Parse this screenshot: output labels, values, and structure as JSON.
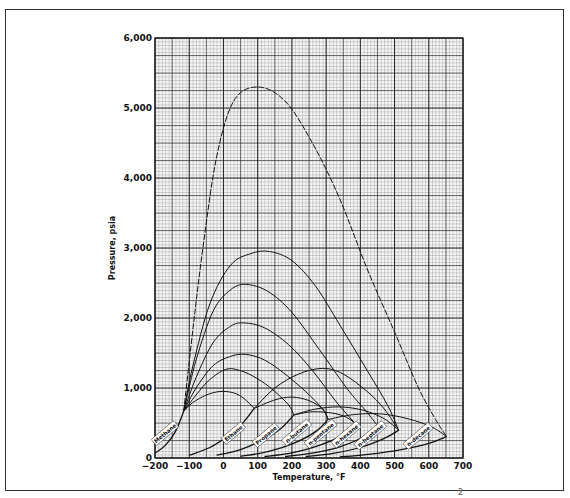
{
  "chart_data": {
    "type": "line",
    "title": "",
    "xlabel": "Temperature, °F",
    "ylabel": "Pressure, psia",
    "xlim": [
      -200,
      700
    ],
    "ylim": [
      0,
      6000
    ],
    "x_ticks": [
      "-200",
      "-100",
      "0",
      "100",
      "200",
      "300",
      "400",
      "500",
      "600",
      "700"
    ],
    "y_ticks": [
      "0",
      "1,000",
      "2,000",
      "3,000",
      "4,000",
      "5,000",
      "6,000"
    ],
    "grid": true,
    "vapor_pressure_curves": [
      {
        "name": "Methane",
        "points": [
          [
            -200,
            70
          ],
          [
            -170,
            180
          ],
          [
            -140,
            380
          ],
          [
            -116,
            668
          ]
        ]
      },
      {
        "name": "Ethane",
        "points": [
          [
            -100,
            40
          ],
          [
            -40,
            150
          ],
          [
            20,
            340
          ],
          [
            60,
            520
          ],
          [
            90,
            708
          ]
        ]
      },
      {
        "name": "Propane",
        "points": [
          [
            -20,
            40
          ],
          [
            50,
            120
          ],
          [
            120,
            270
          ],
          [
            170,
            430
          ],
          [
            206,
            616
          ]
        ]
      },
      {
        "name": "n-butane",
        "points": [
          [
            50,
            25
          ],
          [
            130,
            90
          ],
          [
            210,
            220
          ],
          [
            270,
            380
          ],
          [
            306,
            551
          ]
        ]
      },
      {
        "name": "n-pentane",
        "points": [
          [
            120,
            20
          ],
          [
            200,
            75
          ],
          [
            280,
            180
          ],
          [
            350,
            330
          ],
          [
            386,
            489
          ]
        ]
      },
      {
        "name": "n-hexane",
        "points": [
          [
            180,
            20
          ],
          [
            260,
            70
          ],
          [
            340,
            160
          ],
          [
            410,
            300
          ],
          [
            454,
            437
          ]
        ]
      },
      {
        "name": "n-heptane",
        "points": [
          [
            240,
            20
          ],
          [
            320,
            65
          ],
          [
            400,
            150
          ],
          [
            470,
            280
          ],
          [
            512,
            397
          ]
        ]
      },
      {
        "name": "n-decane",
        "points": [
          [
            340,
            15
          ],
          [
            430,
            55
          ],
          [
            520,
            120
          ],
          [
            600,
            210
          ],
          [
            652,
            305
          ]
        ]
      }
    ],
    "critical_loci": [
      {
        "name": "Methane–n-decane",
        "points": [
          [
            -116,
            668
          ],
          [
            -90,
            1800
          ],
          [
            -60,
            3000
          ],
          [
            -20,
            4300
          ],
          [
            30,
            5100
          ],
          [
            100,
            5300
          ],
          [
            180,
            5100
          ],
          [
            260,
            4500
          ],
          [
            340,
            3700
          ],
          [
            420,
            2700
          ],
          [
            500,
            1800
          ],
          [
            570,
            1000
          ],
          [
            620,
            550
          ],
          [
            652,
            305
          ]
        ]
      },
      {
        "name": "Methane–n-heptane",
        "points": [
          [
            -116,
            668
          ],
          [
            -90,
            1300
          ],
          [
            -40,
            2200
          ],
          [
            20,
            2750
          ],
          [
            80,
            2920
          ],
          [
            135,
            2950
          ],
          [
            200,
            2820
          ],
          [
            270,
            2450
          ],
          [
            340,
            1900
          ],
          [
            420,
            1250
          ],
          [
            480,
            750
          ],
          [
            512,
            397
          ]
        ]
      },
      {
        "name": "Methane–n-hexane",
        "points": [
          [
            -116,
            668
          ],
          [
            -80,
            1400
          ],
          [
            -30,
            2100
          ],
          [
            20,
            2400
          ],
          [
            65,
            2480
          ],
          [
            130,
            2380
          ],
          [
            200,
            2080
          ],
          [
            280,
            1550
          ],
          [
            360,
            1000
          ],
          [
            420,
            650
          ],
          [
            454,
            437
          ]
        ]
      },
      {
        "name": "Methane–n-pentane",
        "points": [
          [
            -116,
            668
          ],
          [
            -80,
            1150
          ],
          [
            -30,
            1650
          ],
          [
            20,
            1880
          ],
          [
            60,
            1930
          ],
          [
            120,
            1860
          ],
          [
            190,
            1620
          ],
          [
            260,
            1250
          ],
          [
            330,
            800
          ],
          [
            386,
            489
          ]
        ]
      },
      {
        "name": "Methane–n-butane",
        "points": [
          [
            -116,
            668
          ],
          [
            -80,
            1000
          ],
          [
            -30,
            1320
          ],
          [
            20,
            1450
          ],
          [
            65,
            1480
          ],
          [
            120,
            1400
          ],
          [
            180,
            1200
          ],
          [
            240,
            950
          ],
          [
            290,
            700
          ],
          [
            306,
            551
          ]
        ]
      },
      {
        "name": "Methane–propane",
        "points": [
          [
            -116,
            668
          ],
          [
            -80,
            900
          ],
          [
            -40,
            1120
          ],
          [
            10,
            1270
          ],
          [
            60,
            1230
          ],
          [
            110,
            1100
          ],
          [
            150,
            950
          ],
          [
            190,
            760
          ],
          [
            206,
            616
          ]
        ]
      },
      {
        "name": "Methane–ethane",
        "points": [
          [
            -116,
            668
          ],
          [
            -90,
            790
          ],
          [
            -50,
            900
          ],
          [
            -10,
            950
          ],
          [
            30,
            930
          ],
          [
            60,
            850
          ],
          [
            90,
            708
          ]
        ]
      },
      {
        "name": "Ethane–n-heptane",
        "points": [
          [
            90,
            708
          ],
          [
            150,
            1000
          ],
          [
            220,
            1200
          ],
          [
            290,
            1280
          ],
          [
            350,
            1200
          ],
          [
            420,
            950
          ],
          [
            470,
            700
          ],
          [
            512,
            397
          ]
        ]
      },
      {
        "name": "Ethane–n-butane",
        "points": [
          [
            90,
            708
          ],
          [
            150,
            830
          ],
          [
            200,
            870
          ],
          [
            250,
            820
          ],
          [
            290,
            700
          ],
          [
            306,
            551
          ]
        ]
      },
      {
        "name": "Propane–n-heptane",
        "points": [
          [
            206,
            616
          ],
          [
            270,
            700
          ],
          [
            340,
            730
          ],
          [
            410,
            680
          ],
          [
            470,
            560
          ],
          [
            512,
            397
          ]
        ]
      },
      {
        "name": "Propane–n-pentane",
        "points": [
          [
            206,
            616
          ],
          [
            260,
            660
          ],
          [
            320,
            640
          ],
          [
            360,
            580
          ],
          [
            386,
            489
          ]
        ]
      },
      {
        "name": "n-butane–n-decane",
        "points": [
          [
            306,
            551
          ],
          [
            380,
            620
          ],
          [
            460,
            630
          ],
          [
            540,
            560
          ],
          [
            610,
            440
          ],
          [
            652,
            305
          ]
        ]
      }
    ],
    "curve_labels": [
      {
        "text": "Methane",
        "x": -170,
        "y": 350
      },
      {
        "text": "Ethane",
        "x": 30,
        "y": 350
      },
      {
        "text": "Propane",
        "x": 125,
        "y": 320
      },
      {
        "text": "n-butane",
        "x": 215,
        "y": 360
      },
      {
        "text": "n-pentane",
        "x": 285,
        "y": 340
      },
      {
        "text": "n-hexane",
        "x": 360,
        "y": 330
      },
      {
        "text": "n-heptane",
        "x": 430,
        "y": 320
      },
      {
        "text": "n-decane",
        "x": 570,
        "y": 310
      }
    ]
  },
  "footer_fragment": "2"
}
